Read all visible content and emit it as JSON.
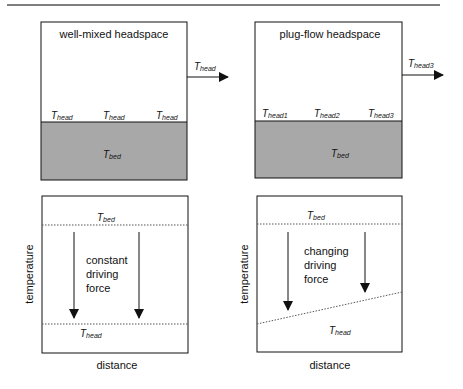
{
  "colors": {
    "bed_fill": "#a8a8a8",
    "line": "#111111",
    "rule": "#555555"
  },
  "top_left": {
    "title": "well-mixed headspace",
    "outlet": {
      "T": "T",
      "sub": "head"
    },
    "surface_labels": [
      {
        "T": "T",
        "sub": "head"
      },
      {
        "T": "T",
        "sub": "head"
      },
      {
        "T": "T",
        "sub": "head"
      }
    ],
    "bed": {
      "T": "T",
      "sub": "bed"
    }
  },
  "top_right": {
    "title": "plug-flow headspace",
    "outlet": {
      "T": "T",
      "sub": "head3"
    },
    "surface_labels": [
      {
        "T": "T",
        "sub": "head1"
      },
      {
        "T": "T",
        "sub": "head2"
      },
      {
        "T": "T",
        "sub": "head3"
      }
    ],
    "bed": {
      "T": "T",
      "sub": "bed"
    }
  },
  "bottom_left": {
    "ylabel": "temperature",
    "xlabel": "distance",
    "top_line": {
      "T": "T",
      "sub": "bed"
    },
    "bottom_line": {
      "T": "T",
      "sub": "head"
    },
    "annotation": [
      "constant",
      "driving",
      "force"
    ]
  },
  "bottom_right": {
    "ylabel": "temperature",
    "xlabel": "distance",
    "top_line": {
      "T": "T",
      "sub": "bed"
    },
    "bottom_line": {
      "T": "T",
      "sub": "head"
    },
    "annotation": [
      "changing",
      "driving",
      "force"
    ]
  }
}
